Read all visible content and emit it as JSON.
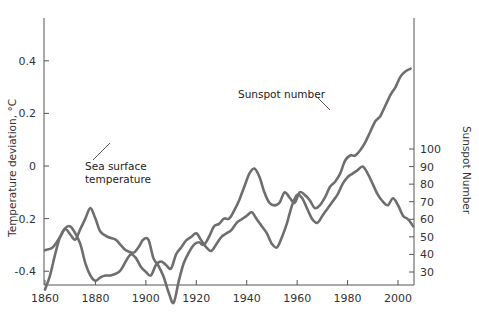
{
  "chart_data": {
    "type": "line",
    "title": "",
    "xlabel": "",
    "ylabel": "Temperature deviation, °C",
    "ylabel_right": "Sunspot Number",
    "xlim": [
      1860,
      2006
    ],
    "ylim": [
      -0.52,
      0.46
    ],
    "ylim_right": [
      10,
      140
    ],
    "x_ticks": [
      1860,
      1880,
      1900,
      1920,
      1940,
      1960,
      1980,
      2000
    ],
    "y_ticks_left": [
      0.4,
      0.2,
      0,
      -0.2,
      -0.4
    ],
    "y_tick_labels_left": [
      "0.4",
      "0.2",
      "0",
      "-0.2",
      "-0.4"
    ],
    "y_ticks_right": [
      30,
      40,
      50,
      60,
      70,
      80,
      90,
      100
    ],
    "grid": false,
    "legend": "none (inline annotations)",
    "annotations": [
      {
        "text": "Sea surface temperature",
        "lines": [
          "Sea surface",
          "temperature"
        ],
        "target_x": 1878,
        "target_series": "Sea surface temperature"
      },
      {
        "text": "Sunspot number",
        "lines": [
          "Sunspot number"
        ],
        "target_x": 1955,
        "target_series": "Sunspot number"
      }
    ],
    "series": [
      {
        "name": "Sea surface temperature",
        "axis": "left",
        "color": "#6e6e6e",
        "x": [
          1860,
          1863,
          1866,
          1868,
          1870,
          1872,
          1874,
          1876,
          1878,
          1880,
          1882,
          1885,
          1888,
          1890,
          1892,
          1895,
          1897,
          1899,
          1901,
          1903,
          1905,
          1907,
          1909,
          1911,
          1913,
          1915,
          1917,
          1919,
          1921,
          1923,
          1925,
          1927,
          1929,
          1931,
          1933,
          1935,
          1937,
          1939,
          1941,
          1943,
          1945,
          1947,
          1949,
          1951,
          1953,
          1955,
          1957,
          1959,
          1961,
          1963,
          1965,
          1967,
          1969,
          1971,
          1973,
          1975,
          1977,
          1979,
          1981,
          1983,
          1985,
          1987,
          1989,
          1991,
          1993,
          1995,
          1997,
          1999,
          2001,
          2003,
          2005
        ],
        "values": [
          -0.32,
          -0.31,
          -0.27,
          -0.24,
          -0.26,
          -0.28,
          -0.24,
          -0.2,
          -0.16,
          -0.2,
          -0.25,
          -0.27,
          -0.28,
          -0.3,
          -0.32,
          -0.33,
          -0.31,
          -0.28,
          -0.28,
          -0.35,
          -0.38,
          -0.42,
          -0.48,
          -0.52,
          -0.44,
          -0.37,
          -0.33,
          -0.3,
          -0.29,
          -0.3,
          -0.27,
          -0.23,
          -0.22,
          -0.2,
          -0.2,
          -0.17,
          -0.13,
          -0.08,
          -0.03,
          -0.01,
          -0.04,
          -0.1,
          -0.14,
          -0.15,
          -0.14,
          -0.1,
          -0.12,
          -0.14,
          -0.1,
          -0.11,
          -0.13,
          -0.16,
          -0.15,
          -0.12,
          -0.08,
          -0.06,
          -0.03,
          0.02,
          0.04,
          0.04,
          0.06,
          0.09,
          0.13,
          0.17,
          0.19,
          0.23,
          0.27,
          0.3,
          0.34,
          0.36,
          0.37
        ]
      },
      {
        "name": "Sunspot number",
        "axis": "right",
        "color": "#6e6e6e",
        "x": [
          1860,
          1862,
          1864,
          1866,
          1868,
          1870,
          1872,
          1874,
          1876,
          1878,
          1880,
          1882,
          1884,
          1886,
          1888,
          1890,
          1892,
          1894,
          1896,
          1898,
          1900,
          1902,
          1904,
          1906,
          1908,
          1910,
          1912,
          1914,
          1916,
          1918,
          1920,
          1922,
          1924,
          1926,
          1928,
          1930,
          1932,
          1934,
          1936,
          1938,
          1940,
          1942,
          1944,
          1946,
          1948,
          1950,
          1952,
          1954,
          1956,
          1958,
          1960,
          1962,
          1964,
          1966,
          1968,
          1970,
          1972,
          1974,
          1976,
          1978,
          1980,
          1982,
          1984,
          1986,
          1988,
          1990,
          1992,
          1994,
          1996,
          1998,
          2000,
          2002,
          2004,
          2006
        ],
        "values": [
          20,
          28,
          40,
          50,
          55,
          56,
          52,
          46,
          35,
          28,
          25,
          27,
          28,
          28,
          29,
          31,
          36,
          40,
          38,
          33,
          30,
          28,
          34,
          36,
          34,
          32,
          40,
          44,
          48,
          50,
          52,
          48,
          44,
          42,
          46,
          50,
          52,
          54,
          58,
          60,
          62,
          64,
          60,
          56,
          52,
          46,
          44,
          50,
          58,
          68,
          74,
          72,
          66,
          60,
          58,
          62,
          66,
          70,
          74,
          80,
          84,
          86,
          88,
          90,
          86,
          80,
          74,
          70,
          68,
          72,
          68,
          62,
          60,
          56
        ]
      }
    ]
  }
}
